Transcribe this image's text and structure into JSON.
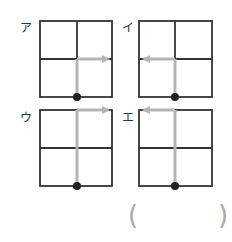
{
  "figures": [
    {
      "id": "a",
      "label": "ア",
      "direction": "right",
      "arrow_row": "middle"
    },
    {
      "id": "i",
      "label": "イ",
      "direction": "left",
      "arrow_row": "middle"
    },
    {
      "id": "u",
      "label": "ウ",
      "direction": "right",
      "arrow_row": "top"
    },
    {
      "id": "e",
      "label": "エ",
      "direction": "left",
      "arrow_row": "top"
    }
  ],
  "answer": {
    "open_paren": "(",
    "close_paren": ")",
    "value": ""
  },
  "colors": {
    "grid": "#333333",
    "arrow": "#b5b5b5",
    "dot": "#222222"
  }
}
